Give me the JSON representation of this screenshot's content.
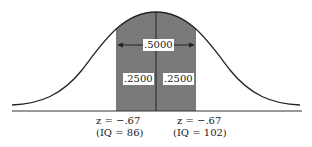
{
  "diagram": {
    "type": "normal-distribution",
    "shaded_region": {
      "total_area_label": ".5000",
      "left_area_label": ".2500",
      "right_area_label": ".2500"
    },
    "left_marker": {
      "z_label": "z = −.67",
      "iq_label": "(IQ = 86)"
    },
    "right_marker": {
      "z_label": "z = −.67",
      "iq_label": "(IQ = 102)"
    },
    "colors": {
      "shade": "#7a7a7a",
      "curve": "#222222",
      "background": "#ffffff"
    }
  }
}
